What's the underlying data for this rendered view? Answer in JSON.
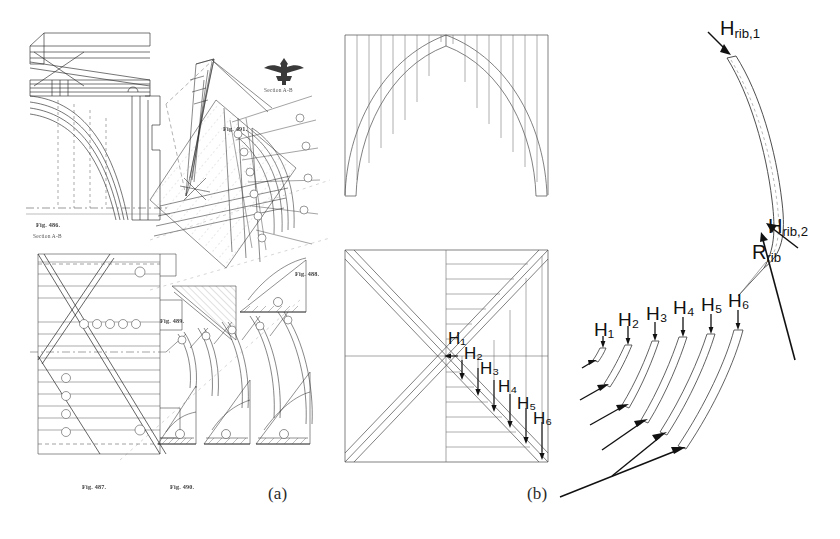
{
  "figure": {
    "background": "#ffffff",
    "ink": "#2b2b2b",
    "width": 840,
    "height": 539
  },
  "captions": [
    {
      "id": "a",
      "label": "(a)",
      "x": 268,
      "y": 484
    },
    {
      "id": "b",
      "label": "(b)",
      "x": 527,
      "y": 484
    }
  ],
  "panel_a": {
    "name": "historical-engineering-plate",
    "description": "Scanned historical plate of gothic vault construction details, line-engraved",
    "figure_numbers": [
      {
        "text": "Fig. 486.",
        "x": 36,
        "y": 221
      },
      {
        "text": "Section A-B",
        "x": 33,
        "y": 233
      },
      {
        "text": "Fig. 491.",
        "x": 223,
        "y": 125
      },
      {
        "text": "Fig. 488.",
        "x": 295,
        "y": 270
      },
      {
        "text": "Fig. 489.",
        "x": 160,
        "y": 317
      },
      {
        "text": "Fig. 487.",
        "x": 82,
        "y": 483
      },
      {
        "text": "Fig. 490.",
        "x": 170,
        "y": 483
      }
    ],
    "emblem": {
      "name": "winged-keystone-emblem",
      "caption": "Section A-B",
      "x": 262,
      "y": 54
    }
  },
  "panel_b": {
    "name": "vault-geometry-panel",
    "elevation": {
      "name": "gothic-arch-elevation",
      "x": 345,
      "y": 35,
      "w": 203,
      "h": 160,
      "hatch_lines": 16,
      "arch_apex_ratio": 0.5,
      "description": "Pointed (gothic) arch with vertical hatching of the spandrel web above the arch"
    },
    "plan": {
      "name": "quadripartite-vault-plan",
      "x": 345,
      "y": 250,
      "w": 203,
      "h": 212,
      "hatch_lines": 13,
      "description": "Square vault bay plan with two diagonal ribs forming an X and horizontal web hatching in the right-hand severy",
      "force_labels": [
        "H₁",
        "H₂",
        "H₃",
        "H₄",
        "H₅",
        "H₆"
      ]
    }
  },
  "panel_c": {
    "name": "rib-thrust-panel",
    "main_rib": {
      "name": "principal-rib-arc",
      "description": "Curved rib arc with dashed centreline",
      "labels": [
        {
          "id": "H_rib_1",
          "base": "H",
          "sub": "rib,1",
          "x": 720,
          "y": 30
        },
        {
          "id": "H_rib_2",
          "base": "H",
          "sub": "rib,2",
          "x": 768,
          "y": 227
        },
        {
          "id": "R_rib",
          "base": "R",
          "sub": "rib",
          "x": 752,
          "y": 252
        }
      ]
    },
    "rib_series": {
      "name": "incremental-rib-segments",
      "count": 6,
      "labels": [
        "H₁",
        "H₂",
        "H₃",
        "H₄",
        "H₅",
        "H₆"
      ],
      "label_positions": [
        {
          "label": "H₁",
          "x": 600,
          "y": 334
        },
        {
          "label": "H₂",
          "x": 625,
          "y": 326
        },
        {
          "label": "H₃",
          "x": 653,
          "y": 320
        },
        {
          "label": "H₄",
          "x": 680,
          "y": 314
        },
        {
          "label": "H₅",
          "x": 707,
          "y": 312
        },
        {
          "label": "H₆",
          "x": 733,
          "y": 309
        }
      ],
      "description": "Six progressively longer rib segments, each loaded by a vertical thrust H_i at the crown and an inclined reaction at the springing"
    }
  }
}
